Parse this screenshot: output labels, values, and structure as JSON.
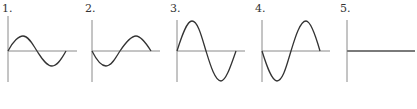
{
  "panels": [
    {
      "label": "1.",
      "description": "sine wave, small amplitude, starts going up"
    },
    {
      "label": "2.",
      "description": "inverted sine wave, small amplitude, starts going down"
    },
    {
      "label": "3.",
      "description": "sine wave, large amplitude, starts going up"
    },
    {
      "label": "4.",
      "description": "inverted sine wave, large amplitude, starts going down"
    },
    {
      "label": "5.",
      "description": "flat line, zero amplitude"
    }
  ],
  "colors": {
    "axis": "#8a8a8a",
    "curve": "#333333",
    "flat": "#7a7a7a"
  }
}
